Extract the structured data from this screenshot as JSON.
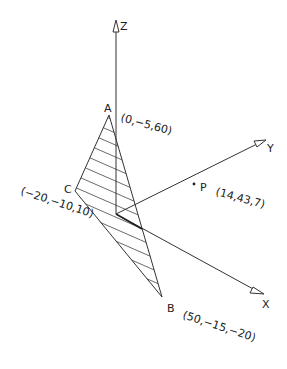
{
  "axes": {
    "x_label": "X",
    "y_label": "Y",
    "z_label": "Z"
  },
  "points": {
    "A": {
      "name": "A",
      "coords": "(0,−5,60)"
    },
    "B": {
      "name": "B",
      "coords": "(50,−15,−20)"
    },
    "C": {
      "name": "C",
      "coords": "(−20,−10,10)"
    },
    "P": {
      "name": "P",
      "coords": "(14,43,7)"
    }
  },
  "colors": {
    "line": "#333333",
    "background": "#ffffff"
  }
}
